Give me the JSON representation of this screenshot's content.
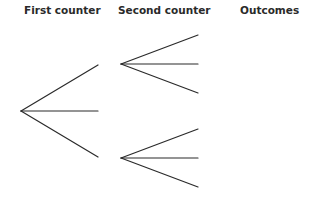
{
  "headers": {
    "first": "First counter",
    "second": "Second counter",
    "outcomes": "Outcomes"
  },
  "tree": {
    "stroke_color": "#2a2a2a",
    "root": [
      21,
      111
    ],
    "first_level_branches": [
      {
        "from": [
          21,
          111
        ],
        "to": [
          98,
          65
        ]
      },
      {
        "from": [
          21,
          111
        ],
        "to": [
          98,
          111
        ]
      },
      {
        "from": [
          21,
          111
        ],
        "to": [
          98,
          157
        ]
      }
    ],
    "second_level_groups": [
      {
        "root": [
          121,
          64
        ],
        "ends": [
          [
            198,
            35
          ],
          [
            198,
            64
          ],
          [
            198,
            93
          ]
        ]
      },
      {
        "root": [
          121,
          158
        ],
        "ends": [
          [
            198,
            129
          ],
          [
            198,
            158
          ],
          [
            198,
            187
          ]
        ]
      }
    ],
    "outcome_labels": []
  }
}
